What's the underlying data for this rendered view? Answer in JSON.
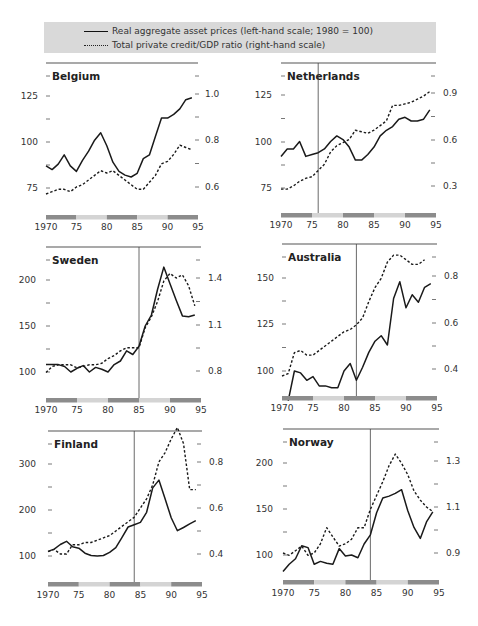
{
  "legend": {
    "solid_label": "Real aggregate asset prices (left-hand scale; 1980 = 100)",
    "dashed_label": "Total private credit/GDP ratio (right-hand scale)"
  },
  "colors": {
    "legend_bg": "#d9d9d9",
    "bar_dark": "#8c8c8c",
    "bar_light": "#d4d4d4",
    "line": "#1a1a1a",
    "axis": "#555555"
  },
  "chart_data": [
    {
      "type": "line",
      "title": "Belgium",
      "x": [
        1970,
        1971,
        1972,
        1973,
        1974,
        1975,
        1976,
        1977,
        1978,
        1979,
        1980,
        1981,
        1982,
        1983,
        1984,
        1985,
        1986,
        1987,
        1988,
        1989,
        1990,
        1991,
        1992,
        1993,
        1994
      ],
      "x_ticks": [
        "1970",
        "75",
        "80",
        "85",
        "90",
        "95"
      ],
      "xlim": [
        1970,
        1995
      ],
      "left_ticks": [
        "125",
        "100",
        "75"
      ],
      "left_tick_values": [
        125,
        100,
        75
      ],
      "right_ticks": [
        "1.0",
        "0.8",
        "0.6"
      ],
      "right_tick_values": [
        1.0,
        0.8,
        0.6
      ],
      "vline": null,
      "series": [
        {
          "name": "Real aggregate asset prices",
          "axis": "left",
          "style": "solid",
          "values": [
            87,
            85,
            88,
            93,
            87,
            84,
            90,
            95,
            101,
            105,
            98,
            89,
            84,
            82,
            81,
            83,
            91,
            93,
            103,
            113,
            113,
            115,
            118,
            123,
            124
          ]
        },
        {
          "name": "Total private credit/GDP ratio",
          "axis": "right",
          "style": "dashed",
          "values": [
            0.57,
            0.58,
            0.59,
            0.59,
            0.58,
            0.6,
            0.61,
            0.63,
            0.65,
            0.67,
            0.66,
            0.67,
            0.65,
            0.63,
            0.61,
            0.59,
            0.59,
            0.62,
            0.65,
            0.7,
            0.71,
            0.74,
            0.78,
            0.77,
            0.76
          ]
        }
      ]
    },
    {
      "type": "line",
      "title": "Netherlands",
      "x": [
        1970,
        1971,
        1972,
        1973,
        1974,
        1975,
        1976,
        1977,
        1978,
        1979,
        1980,
        1981,
        1982,
        1983,
        1984,
        1985,
        1986,
        1987,
        1988,
        1989,
        1990,
        1991,
        1992,
        1993,
        1994
      ],
      "x_ticks": [
        "1970",
        "75",
        "80",
        "85",
        "90",
        "95"
      ],
      "xlim": [
        1970,
        1995
      ],
      "left_ticks": [
        "125",
        "100",
        "75"
      ],
      "left_tick_values": [
        125,
        100,
        75
      ],
      "right_ticks": [
        "0.9",
        "0.6",
        "0.3"
      ],
      "right_tick_values": [
        0.9,
        0.6,
        0.3
      ],
      "vline": 1976,
      "series": [
        {
          "name": "Real aggregate asset prices",
          "axis": "left",
          "style": "solid",
          "values": [
            92,
            96,
            96,
            100,
            92,
            93,
            94,
            96,
            100,
            103,
            101,
            97,
            90,
            90,
            93,
            97,
            103,
            106,
            108,
            112,
            113,
            111,
            111,
            112,
            117
          ]
        },
        {
          "name": "Total private credit/GDP ratio",
          "axis": "right",
          "style": "dashed",
          "values": [
            0.28,
            0.28,
            0.3,
            0.33,
            0.35,
            0.36,
            0.4,
            0.44,
            0.52,
            0.56,
            0.58,
            0.6,
            0.66,
            0.65,
            0.64,
            0.66,
            0.69,
            0.72,
            0.82,
            0.82,
            0.83,
            0.84,
            0.86,
            0.88,
            0.91
          ]
        }
      ]
    },
    {
      "type": "line",
      "title": "Sweden",
      "x": [
        1970,
        1971,
        1972,
        1973,
        1974,
        1975,
        1976,
        1977,
        1978,
        1979,
        1980,
        1981,
        1982,
        1983,
        1984,
        1985,
        1986,
        1987,
        1988,
        1989,
        1990,
        1991,
        1992,
        1993,
        1994
      ],
      "x_ticks": [
        "1970",
        "75",
        "80",
        "85",
        "90",
        "95"
      ],
      "xlim": [
        1970,
        1995
      ],
      "left_ticks": [
        "200",
        "150",
        "100"
      ],
      "left_tick_values": [
        200,
        150,
        100
      ],
      "right_ticks": [
        "1.4",
        "1.1",
        "0.8"
      ],
      "right_tick_values": [
        1.4,
        1.1,
        0.8
      ],
      "vline": 1985,
      "series": [
        {
          "name": "Real aggregate asset prices",
          "axis": "left",
          "style": "solid",
          "values": [
            108,
            108,
            108,
            106,
            100,
            104,
            107,
            100,
            105,
            103,
            100,
            108,
            112,
            123,
            119,
            128,
            150,
            162,
            190,
            214,
            196,
            178,
            161,
            160,
            162
          ]
        },
        {
          "name": "Total private credit/GDP ratio",
          "axis": "right",
          "style": "dashed",
          "values": [
            0.79,
            0.83,
            0.84,
            0.84,
            0.84,
            0.82,
            0.83,
            0.84,
            0.84,
            0.85,
            0.88,
            0.9,
            0.93,
            0.95,
            0.95,
            0.95,
            1.08,
            1.15,
            1.25,
            1.38,
            1.43,
            1.4,
            1.42,
            1.35,
            1.22
          ]
        }
      ]
    },
    {
      "type": "line",
      "title": "Australia",
      "x": [
        1970,
        1971,
        1972,
        1973,
        1974,
        1975,
        1976,
        1977,
        1978,
        1979,
        1980,
        1981,
        1982,
        1983,
        1984,
        1985,
        1986,
        1987,
        1988,
        1989,
        1990,
        1991,
        1992,
        1993,
        1994
      ],
      "x_ticks": [
        "1970",
        "75",
        "80",
        "85",
        "90",
        "95"
      ],
      "xlim": [
        1970,
        1995
      ],
      "left_ticks": [
        "150",
        "125",
        "100"
      ],
      "left_tick_values": [
        150,
        125,
        100
      ],
      "right_ticks": [
        "0.8",
        "0.6",
        "0.4"
      ],
      "right_tick_values": [
        0.8,
        0.6,
        0.4
      ],
      "vline": 1982,
      "series": [
        {
          "name": "Real aggregate asset prices",
          "axis": "left",
          "style": "solid",
          "values": null,
          "x": [
            1971,
            1972,
            1973,
            1974,
            1975,
            1976,
            1977,
            1978,
            1979,
            1980,
            1981,
            1982,
            1983,
            1984,
            1985,
            1986,
            1987,
            1988,
            1989,
            1990,
            1991,
            1992,
            1993,
            1994
          ],
          "y": [
            84,
            100,
            99,
            95,
            97,
            92,
            92,
            91,
            91,
            100,
            104,
            95,
            102,
            110,
            116,
            119,
            114,
            139,
            148,
            134,
            141,
            137,
            145,
            147
          ]
        },
        {
          "name": "Total private credit/GDP ratio",
          "axis": "right",
          "style": "dashed",
          "values": [
            0.37,
            0.38,
            0.47,
            0.48,
            0.46,
            0.46,
            0.48,
            0.5,
            0.52,
            0.54,
            0.56,
            0.57,
            0.59,
            0.62,
            0.69,
            0.75,
            0.79,
            0.86,
            0.89,
            0.89,
            0.87,
            0.85,
            0.85,
            0.87
          ]
        }
      ]
    },
    {
      "type": "line",
      "title": "Finland",
      "x": [
        1970,
        1971,
        1972,
        1973,
        1974,
        1975,
        1976,
        1977,
        1978,
        1979,
        1980,
        1981,
        1982,
        1983,
        1984,
        1985,
        1986,
        1987,
        1988,
        1989,
        1990,
        1991,
        1992,
        1993,
        1994
      ],
      "x_ticks": [
        "1970",
        "75",
        "80",
        "85",
        "90",
        "95"
      ],
      "xlim": [
        1970,
        1995
      ],
      "left_ticks": [
        "300",
        "200",
        "100"
      ],
      "left_tick_values": [
        300,
        200,
        100
      ],
      "right_ticks": [
        "0.8",
        "0.6",
        "0.4"
      ],
      "right_tick_values": [
        0.8,
        0.6,
        0.4
      ],
      "vline": 1984,
      "series": [
        {
          "name": "Real aggregate asset prices",
          "axis": "left",
          "style": "solid",
          "values": [
            110,
            115,
            125,
            132,
            120,
            117,
            106,
            101,
            100,
            101,
            108,
            118,
            140,
            163,
            168,
            173,
            195,
            248,
            265,
            225,
            183,
            155,
            162,
            170,
            177
          ]
        },
        {
          "name": "Total private credit/GDP ratio",
          "axis": "right",
          "style": "dashed",
          "values": [
            0.41,
            0.42,
            0.4,
            0.4,
            0.44,
            0.44,
            0.45,
            0.45,
            0.46,
            0.47,
            0.48,
            0.5,
            0.52,
            0.54,
            0.56,
            0.6,
            0.64,
            0.7,
            0.8,
            0.84,
            0.9,
            0.95,
            0.88,
            0.68,
            0.68
          ]
        }
      ]
    },
    {
      "type": "line",
      "title": "Norway",
      "x": [
        1970,
        1971,
        1972,
        1973,
        1974,
        1975,
        1976,
        1977,
        1978,
        1979,
        1980,
        1981,
        1982,
        1983,
        1984,
        1985,
        1986,
        1987,
        1988,
        1989,
        1990,
        1991,
        1992,
        1993,
        1994
      ],
      "x_ticks": [
        "1970",
        "75",
        "80",
        "85",
        "90",
        "95"
      ],
      "xlim": [
        1970,
        1995
      ],
      "left_ticks": [
        "200",
        "150",
        "100"
      ],
      "left_tick_values": [
        200,
        150,
        100
      ],
      "right_ticks": [
        "1.3",
        "1.1",
        "0.9"
      ],
      "right_tick_values": [
        1.3,
        1.1,
        0.9
      ],
      "vline": 1984,
      "series": [
        {
          "name": "Real aggregate asset prices",
          "axis": "left",
          "style": "solid",
          "values": [
            82,
            90,
            96,
            110,
            108,
            90,
            93,
            91,
            90,
            107,
            99,
            100,
            97,
            112,
            122,
            146,
            162,
            164,
            167,
            171,
            148,
            130,
            118,
            136,
            147
          ]
        },
        {
          "name": "Total private credit/GDP ratio",
          "axis": "right",
          "style": "dashed",
          "values": [
            0.9,
            0.89,
            0.91,
            0.93,
            0.89,
            0.9,
            0.94,
            1.01,
            0.97,
            0.93,
            0.94,
            0.96,
            1.01,
            1.01,
            1.09,
            1.15,
            1.21,
            1.28,
            1.33,
            1.29,
            1.24,
            1.17,
            1.13,
            1.1,
            1.08
          ]
        }
      ]
    }
  ]
}
